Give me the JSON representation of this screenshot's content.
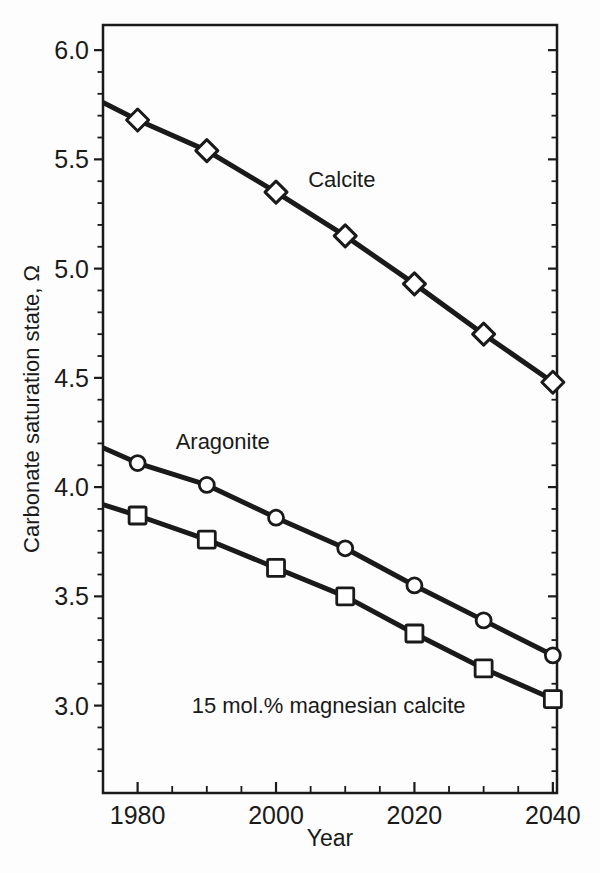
{
  "figure": {
    "background": "#fdfdfd",
    "ink_color": "#1a1a1a",
    "marker_fill": "#ffffff"
  },
  "chart_data": {
    "type": "line",
    "title": "",
    "xlabel": "Year",
    "ylabel": "Carbonate saturation state, Ω",
    "xlim": [
      1975,
      2040.6
    ],
    "ylim": [
      2.6,
      6.115
    ],
    "grid": false,
    "legend_position": "inline-labels",
    "x": [
      1975,
      1980,
      1990,
      2000,
      2010,
      2020,
      2030,
      2040
    ],
    "series": [
      {
        "name": "Calcite",
        "marker": "diamond",
        "values": [
          5.76,
          5.68,
          5.54,
          5.35,
          5.15,
          4.93,
          4.7,
          4.48
        ]
      },
      {
        "name": "Aragonite",
        "marker": "circle",
        "values": [
          4.18,
          4.11,
          4.01,
          3.86,
          3.72,
          3.55,
          3.39,
          3.23
        ]
      },
      {
        "name": "15 mol.% magnesian calcite",
        "marker": "square",
        "values": [
          3.92,
          3.87,
          3.76,
          3.63,
          3.5,
          3.33,
          3.17,
          3.03
        ]
      }
    ],
    "marker_skip_first_point": true,
    "x_major_ticks": [
      1980,
      2000,
      2020,
      2040
    ],
    "x_tick_labels": [
      "1980",
      "2000",
      "2020",
      "2040"
    ],
    "x_minor_tick_step": 5,
    "y_major_ticks": [
      3.0,
      3.5,
      4.0,
      4.5,
      5.0,
      5.5,
      6.0
    ],
    "y_tick_labels": [
      "3.0",
      "3.5",
      "4.0",
      "4.5",
      "5.0",
      "5.5",
      "6.0"
    ],
    "y_minor_tick_step": 0.1,
    "annotations": [
      {
        "text": "Calcite",
        "x": 2009.5,
        "y": 5.41
      },
      {
        "text": "Aragonite",
        "x": 1992.3,
        "y": 4.21
      },
      {
        "text": "15 mol.% magnesian calcite",
        "x": 2007.6,
        "y": 3.0
      }
    ]
  }
}
